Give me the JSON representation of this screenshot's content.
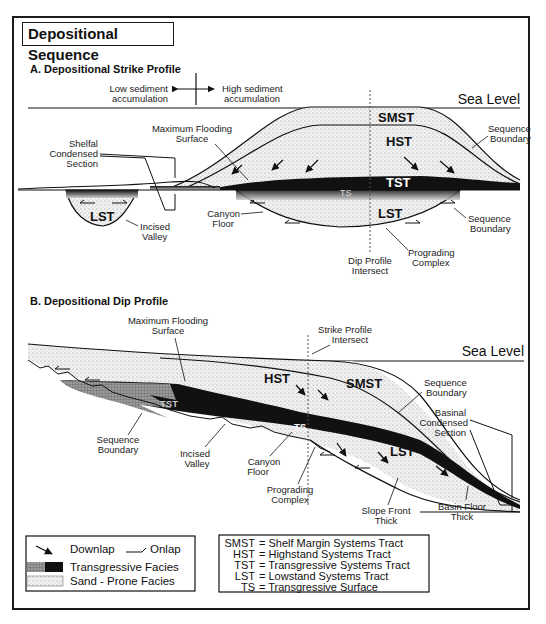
{
  "title": "Depositional Sequence",
  "strike_profile": {
    "heading": "A. Depositional Strike Profile",
    "low_label_1": "Low sediment",
    "low_label_2": "accumulation",
    "high_label_1": "High sediment",
    "high_label_2": "accumulation",
    "sea_level": "Sea Level",
    "tracts": {
      "smst": "SMST",
      "hst": "HST",
      "tst": "TST",
      "ts": "TS",
      "lst_main": "LST",
      "lst_valley": "LST"
    },
    "annotations": {
      "mfs_1": "Maximum Flooding",
      "mfs_2": "Surface",
      "shelfal_1": "Shelfal",
      "shelfal_2": "Condensed",
      "shelfal_3": "Section",
      "seqb_top_1": "Sequence",
      "seqb_top_2": "Boundary",
      "seqb_bot_1": "Sequence",
      "seqb_bot_2": "Boundary",
      "incised_1": "Incised",
      "incised_2": "Valley",
      "canyon_1": "Canyon",
      "canyon_2": "Floor",
      "dip_int_1": "Dip Profile",
      "dip_int_2": "Intersect",
      "prog_1": "Prograding",
      "prog_2": "Complex"
    }
  },
  "dip_profile": {
    "heading": "B. Depositional Dip Profile",
    "sea_level": "Sea Level",
    "tracts": {
      "hst": "HST",
      "smst": "SMST",
      "tst": "TST",
      "ts": "TS",
      "lst": "LST"
    },
    "annotations": {
      "mfs_1": "Maximum Flooding",
      "mfs_2": "Surface",
      "strike_int_1": "Strike Profile",
      "strike_int_2": "Intersect",
      "seqb_left_1": "Sequence",
      "seqb_left_2": "Boundary",
      "seqb_right_1": "Sequence",
      "seqb_right_2": "Boundary",
      "incised_1": "Incised",
      "incised_2": "Valley",
      "canyon_1": "Canyon",
      "canyon_2": "Floor",
      "prog_1": "Prograding",
      "prog_2": "Complex",
      "basinal_1": "Basinal",
      "basinal_2": "Condensed",
      "basinal_3": "Section",
      "slope_1": "Slope Front",
      "slope_2": "Thick",
      "basin_1": "Basin Floor",
      "basin_2": "Thick"
    }
  },
  "legend": {
    "downlap": "Downlap",
    "onlap": "Onlap",
    "transgressive": "Transgressive Facies",
    "sand": "Sand - Prone Facies"
  },
  "abbreviations": [
    {
      "abbr": "SMST",
      "def": "= Shelf Margin Systems Tract"
    },
    {
      "abbr": "HST",
      "def": "= Highstand Systems Tract"
    },
    {
      "abbr": "TST",
      "def": "= Transgressive Systems Tract"
    },
    {
      "abbr": "LST",
      "def": "= Lowstand Systems Tract"
    },
    {
      "abbr": "TS",
      "def": "= Transgressive Surface"
    }
  ],
  "colors": {
    "ink": "#111111",
    "sand": "#e9e9e9",
    "transgressive": "#111111",
    "hatch": "#8a8a8a"
  }
}
